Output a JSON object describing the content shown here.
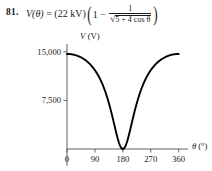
{
  "problem": {
    "number": "81.",
    "function_name": "V",
    "variable": "θ",
    "amplitude": "22 kV",
    "formula_plain": "V(θ) = (22 kV)(1 − 1/√(5 + 4 cos θ))",
    "parts": {
      "lhs": "V(θ)",
      "equals": "=",
      "coefficient": "(22 kV)",
      "one": "1",
      "minus": "−",
      "numerator": "1",
      "radicand": "5 + 4 cos θ",
      "radical_sign": "√"
    }
  },
  "chart_data": {
    "type": "line",
    "title": "",
    "xlabel": "θ (°)",
    "ylabel": "V (V)",
    "ylabel_symbol": "V",
    "ylabel_units": "(V)",
    "xlabel_symbol": "θ",
    "xlabel_units": "(°)",
    "xticks": [
      0,
      90,
      180,
      270,
      360
    ],
    "xtick_labels": [
      "0",
      "90",
      "180",
      "270",
      "360"
    ],
    "yticks": [
      7500,
      15000
    ],
    "ytick_labels": [
      "7,500",
      "15,000"
    ],
    "xlim": [
      0,
      390
    ],
    "ylim": [
      0,
      16200
    ],
    "grid": false,
    "legend": false,
    "equation": "V(theta) = 22000 * (1 - 1/sqrt(5 + 4*cos(theta)))",
    "amplitude_volts": 22000,
    "x": [
      0,
      15,
      30,
      45,
      60,
      75,
      90,
      105,
      120,
      135,
      150,
      165,
      180,
      195,
      210,
      225,
      240,
      255,
      270,
      285,
      300,
      315,
      330,
      345,
      360
    ],
    "y": [
      14667,
      14645,
      14574,
      14444,
      14237,
      13919,
      13436,
      12693,
      11536,
      9727,
      6917,
      2787,
      0,
      2787,
      6917,
      9727,
      11536,
      12693,
      13436,
      13919,
      14237,
      14444,
      14574,
      14645,
      14667
    ],
    "series": [
      {
        "name": "V(θ)",
        "color": "#000000",
        "values": [
          14667,
          14645,
          14574,
          14444,
          14237,
          13919,
          13436,
          12693,
          11536,
          9727,
          6917,
          2787,
          0,
          2787,
          6917,
          9727,
          11536,
          12693,
          13436,
          13919,
          14237,
          14444,
          14574,
          14645,
          14667
        ]
      }
    ],
    "colors": {
      "curve": "#000000",
      "axis": "#4f4f4f",
      "text": "#1a1a1a",
      "background": "#ffffff"
    }
  }
}
